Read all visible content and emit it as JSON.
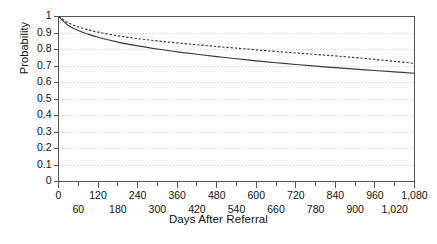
{
  "chart_data": {
    "type": "line",
    "title": "",
    "xlabel": "Days After Referral",
    "ylabel": "Probability",
    "xlim": [
      0,
      1080
    ],
    "ylim": [
      0,
      1
    ],
    "grid": "horizontal-dotted",
    "legend": "none",
    "x_tick_labels_upper": [
      "0",
      "120",
      "240",
      "360",
      "480",
      "600",
      "720",
      "840",
      "960",
      "1,080"
    ],
    "x_tick_values_upper": [
      0,
      120,
      240,
      360,
      480,
      600,
      720,
      840,
      960,
      1080
    ],
    "x_tick_labels_lower": [
      "60",
      "180",
      "300",
      "420",
      "540",
      "660",
      "780",
      "900",
      "1,020"
    ],
    "x_tick_values_lower": [
      60,
      180,
      300,
      420,
      540,
      660,
      780,
      900,
      1020
    ],
    "y_tick_labels": [
      "1",
      "0.9",
      "0.8",
      "0.7",
      "0.6",
      "0.5",
      "0.4",
      "0.3",
      "0.2",
      "0.1",
      "0"
    ],
    "y_tick_values": [
      1,
      0.9,
      0.8,
      0.7,
      0.6,
      0.5,
      0.4,
      0.3,
      0.2,
      0.1,
      0
    ],
    "series": [
      {
        "name": "solid-curve",
        "style": "solid",
        "color": "#3a3a3a",
        "x": [
          0,
          30,
          60,
          90,
          120,
          180,
          240,
          300,
          360,
          420,
          480,
          540,
          600,
          660,
          720,
          780,
          840,
          900,
          960,
          1020,
          1080
        ],
        "values": [
          1.0,
          0.945,
          0.915,
          0.893,
          0.874,
          0.845,
          0.822,
          0.803,
          0.786,
          0.771,
          0.757,
          0.744,
          0.731,
          0.72,
          0.709,
          0.699,
          0.69,
          0.681,
          0.673,
          0.664,
          0.656
        ]
      },
      {
        "name": "dotted-curve",
        "style": "dotted",
        "color": "#3a3a3a",
        "x": [
          0,
          30,
          60,
          90,
          120,
          180,
          240,
          300,
          360,
          420,
          480,
          540,
          600,
          660,
          720,
          780,
          840,
          900,
          960,
          1020,
          1080
        ],
        "values": [
          1.0,
          0.962,
          0.937,
          0.919,
          0.905,
          0.883,
          0.866,
          0.852,
          0.84,
          0.829,
          0.818,
          0.808,
          0.798,
          0.788,
          0.779,
          0.77,
          0.761,
          0.751,
          0.74,
          0.728,
          0.716
        ]
      }
    ]
  },
  "axes": {
    "y_title": "Probability",
    "x_title": "Days After Referral"
  },
  "colors": {
    "frame": "#555555",
    "grid": "#c8c8c8",
    "curve": "#3a3a3a",
    "background": "#ffffff",
    "text": "#111111"
  }
}
